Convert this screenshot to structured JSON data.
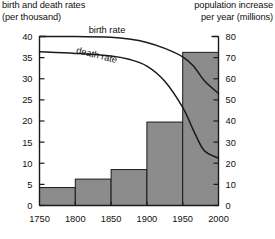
{
  "header": {
    "left_axis_title": "birth and death rates\n(per thousand)",
    "right_axis_title": "population increase\nper year (millions)"
  },
  "labels": {
    "birth_rate": "birth rate",
    "death_rate": "death rate"
  },
  "colors": {
    "bar_fill": "#8c8c8c",
    "bar_stroke": "#1a1a1a",
    "axis": "#1a1a1a",
    "curve": "#1a1a1a",
    "background": "#ffffff"
  },
  "chart_data": {
    "type": "bar",
    "title": "",
    "subtitle": "",
    "xlabel": "",
    "ylabel": "birth and death rates (per thousand)",
    "y2label": "population increase per year (millions)",
    "grid": false,
    "legend": "inline-curve-labels",
    "xlim": [
      1750,
      2000
    ],
    "ylim": [
      0,
      40
    ],
    "y2lim": [
      0,
      80
    ],
    "xticks": [
      1750,
      1800,
      1850,
      1900,
      1950,
      2000
    ],
    "xtick_labels": [
      "1750",
      "1800",
      "1850",
      "1900",
      "1950",
      "2000"
    ],
    "yticks": [
      0,
      5,
      10,
      15,
      20,
      25,
      30,
      35,
      40
    ],
    "ytick_labels": [
      "0",
      "5",
      "10",
      "15",
      "20",
      "25",
      "30",
      "35",
      "40"
    ],
    "y2ticks": [
      0,
      10,
      20,
      30,
      40,
      50,
      60,
      70,
      80
    ],
    "y2tick_labels": [
      "0",
      "10",
      "20",
      "30",
      "40",
      "50",
      "60",
      "70",
      "80"
    ],
    "bars": {
      "name": "population increase per year (millions)",
      "axis": "right",
      "intervals": [
        {
          "from": 1750,
          "to": 1800,
          "value": 8.5
        },
        {
          "from": 1800,
          "to": 1850,
          "value": 12.5
        },
        {
          "from": 1850,
          "to": 1900,
          "value": 17
        },
        {
          "from": 1900,
          "to": 1950,
          "value": 39.5
        },
        {
          "from": 1950,
          "to": 2000,
          "value": 72.5
        }
      ]
    },
    "series": [
      {
        "name": "birth rate",
        "axis": "left",
        "unit": "per thousand",
        "x": [
          1750,
          1800,
          1850,
          1875,
          1900,
          1925,
          1950,
          1965,
          1980,
          2000
        ],
        "values": [
          40,
          40,
          39.8,
          39.4,
          38.6,
          37.2,
          35.2,
          33,
          29.6,
          26.5
        ]
      },
      {
        "name": "death rate",
        "axis": "left",
        "unit": "per thousand",
        "x": [
          1750,
          1800,
          1850,
          1875,
          1900,
          1925,
          1950,
          1965,
          1980,
          2000
        ],
        "values": [
          36.4,
          36,
          35.4,
          34.6,
          33,
          29.4,
          23.2,
          17.8,
          13,
          11.2
        ]
      }
    ]
  }
}
